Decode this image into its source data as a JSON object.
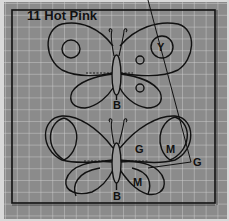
{
  "pattern": {
    "title": "11 Hot Pink",
    "background_color": "#8a8a8a",
    "grid_color": "#c8c8c8",
    "line_color": "#111111"
  },
  "butterflies": [
    {
      "position": "top",
      "labels": [
        {
          "text": "Y",
          "meaning": "upper-right wing circle"
        },
        {
          "text": "O",
          "meaning": "upper-right small circle"
        },
        {
          "text": "O",
          "meaning": "lower-right small circle"
        },
        {
          "text": "B",
          "meaning": "body"
        }
      ]
    },
    {
      "position": "bottom",
      "labels": [
        {
          "text": "G",
          "meaning": "upper-right wing"
        },
        {
          "text": "M",
          "meaning": "upper-right wing inner"
        },
        {
          "text": "G",
          "meaning": "leader line label"
        },
        {
          "text": "M",
          "meaning": "lower-right wing inner"
        },
        {
          "text": "B",
          "meaning": "body"
        }
      ]
    }
  ]
}
